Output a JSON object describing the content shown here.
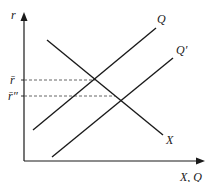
{
  "diagram": {
    "type": "economics-line-diagram",
    "axes": {
      "y_label": "r",
      "x_label": "X, Q"
    },
    "curves": [
      {
        "id": "X",
        "label": "X",
        "from": [
          47,
          40
        ],
        "to": [
          163,
          135
        ]
      },
      {
        "id": "Q",
        "label": "Q",
        "from": [
          33,
          130
        ],
        "to": [
          156,
          28
        ]
      },
      {
        "id": "Q_prime",
        "label": "Q′",
        "from": [
          52,
          157
        ],
        "to": [
          173,
          58
        ]
      }
    ],
    "levels": [
      {
        "id": "r_bar",
        "label": "r̄",
        "y": 80
      },
      {
        "id": "r_bar_double_prime",
        "label": "r̄″",
        "y": 96
      }
    ],
    "colors": {
      "line": "#1a1a1a",
      "dashed": "#555555",
      "background": "#ffffff"
    }
  }
}
